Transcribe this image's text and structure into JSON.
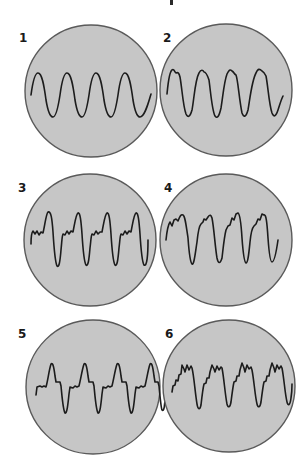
{
  "figure": {
    "background": "#ffffff",
    "circle_fill": "#c6c6c6",
    "circle_stroke": "#5a5a5a",
    "trace_color": "#1c1c1c",
    "panels": [
      {
        "label": "1",
        "label_pos": [
          19,
          32
        ],
        "center": [
          91,
          91
        ],
        "radius": 66,
        "description": "pure sine wave, four cycles",
        "path": "M31,95 C33,80 35,73 38,73 C42,73 44,85 46,100 C48,112 50,117 53,117 C56,117 58,108 60,95 C62,80 64,73 67,73 C71,73 73,85 75,100 C77,112 79,117 82,117 C85,117 87,108 89,95 C91,80 93,73 96,73 C100,73 102,85 104,100 C106,112 108,117 111,117 C114,117 116,108 118,95 C120,80 122,73 125,73 C129,73 131,85 133,100 C135,112 137,117 140,117 C144,117 147,108 151,94"
      },
      {
        "label": "2",
        "label_pos": [
          163,
          32
        ],
        "center": [
          226,
          90
        ],
        "radius": 66,
        "description": "sine with small notch near each peak",
        "path": "M167,94 C168,84 169,72 172,70 C174,68 175,73 176,73 C178,72 179,73 180,77 C182,88 183,106 186,114 C188,118 190,117 192,110 C194,100 195,80 199,73 C201,69 203,70 204,72 C206,72 207,74 209,80 C211,95 212,110 215,116 C217,119 219,117 221,108 C223,96 224,82 227,74 C229,70 230,69 232,71 C234,72 234,74 236,75 C238,80 239,98 242,113 C244,118 246,117 248,110 C250,98 252,80 256,73 C258,68 260,69 262,71 C264,72 265,74 266,76 C268,86 269,104 272,113 C274,118 276,116 278,110 C280,104 281,100 283,96"
      },
      {
        "label": "3",
        "label_pos": [
          18,
          182
        ],
        "center": [
          90,
          240
        ],
        "radius": 66,
        "description": "sharp upward peaks with small ripples on a plateau, deep troughs",
        "path": "M31,244 C31,238 32,232 33,231 L35,234 L37,231 L39,235 L41,232 L43,233 C45,225 46,214 48,212 C51,211 52,218 53,232 C54,248 55,262 57,266 C59,268 60,262 61,250 C62,240 62,236 63,234 L65,235 L67,231 L69,234 L71,231 L73,232 C75,222 76,214 78,213 C80,212 81,220 82,234 C83,250 84,262 86,265 C88,267 89,260 90,248 C91,240 91,236 92,234 L94,235 L96,231 L98,234 L100,232 L102,232 C104,222 105,214 107,213 C109,212 110,220 111,234 C112,250 113,262 115,265 C117,267 118,260 119,248 C120,240 120,236 121,234 L123,235 L125,231 L127,234 L129,231 L131,232 C133,222 134,214 136,213 C138,212 139,220 140,234 C141,250 142,262 144,265 C147,267 148,255 148,240"
      },
      {
        "label": "4",
        "label_pos": [
          164,
          182
        ],
        "center": [
          226,
          240
        ],
        "radius": 66,
        "description": "irregular peaks with multiple bumps, deep troughs",
        "path": "M166,240 C167,230 168,225 170,222 L172,226 L174,220 L176,219 L178,221 C180,216 181,214 183,215 C185,216 186,224 188,238 C189,252 190,262 192,264 C194,265 195,255 197,242 C198,232 199,226 201,224 L203,222 L204,219 L206,220 L208,217 C210,214 211,215 212,218 C214,228 215,246 217,258 C218,263 220,265 222,258 C223,250 224,238 226,230 L228,226 L230,225 L232,218 L234,220 L236,214 L238,213 C240,214 241,222 242,238 C243,252 244,262 246,263 C248,263 249,252 250,242 C251,232 252,228 254,226 L256,224 L258,219 L260,220 L262,214 L264,215 C266,214 267,222 268,238 C269,252 270,262 272,262 C274,262 276,254 278,240"
      },
      {
        "label": "5",
        "label_pos": [
          18,
          328
        ],
        "center": [
          93,
          387
        ],
        "radius": 67,
        "description": "flat steps with narrow positive spikes and sharp negative dips",
        "path": "M36,395 L37,387 L40,386 L42,387 L44,386 L46,387 C48,380 49,370 51,364 C53,362 54,368 55,376 L56,382 L60,382 L61,386 C62,396 63,410 65,413 C67,414 68,404 69,394 L70,387 L73,388 L75,386 L77,387 L79,386 C81,378 82,370 84,364 C86,362 87,368 88,376 L89,382 L93,382 L94,386 C95,396 96,410 98,413 C100,414 101,404 102,394 L103,387 L106,388 L108,386 L110,387 L112,386 C114,378 115,370 117,364 C119,362 120,368 121,376 L122,382 L126,382 L127,386 C128,396 129,410 131,413 C133,414 134,404 135,394 L136,387 L139,388 L141,386 L143,387 L145,386 C147,378 148,370 150,364 C152,362 153,368 154,376 L155,382 L158,382 L159,386 C160,396 161,408 162,410 C164,412 165,405 165,396"
      },
      {
        "label": "6",
        "label_pos": [
          165,
          328
        ],
        "center": [
          229,
          386
        ],
        "radius": 66,
        "description": "complex jagged plateau with many small peaks, sharp troughs",
        "path": "M172,392 L173,386 L175,385 L176,380 L178,381 L179,375 L181,374 L182,365 L184,369 L185,372 L187,365 L189,370 L191,366 L192,368 C194,376 195,392 197,404 C198,410 200,410 201,405 C202,396 203,388 204,384 L206,383 L207,378 L209,378 L210,372 L212,365 L214,369 L215,372 L217,366 L219,370 L221,367 L222,368 C224,378 225,394 227,404 C228,408 230,408 231,402 C232,394 233,386 234,382 L236,381 L237,376 L239,376 L240,370 L242,363 L244,368 L245,372 L247,365 L249,369 L251,367 L252,370 C254,380 255,396 257,404 C258,408 260,408 261,402 C262,394 263,386 264,382 L266,381 L267,376 L269,376 L270,370 L272,363 L274,368 L275,372 L277,365 L279,369 L281,366 L282,368 C284,378 285,394 287,402 C288,406 290,406 291,398 C292,392 292,388 292,384"
      }
    ],
    "top_mark": {
      "visible": true
    }
  }
}
